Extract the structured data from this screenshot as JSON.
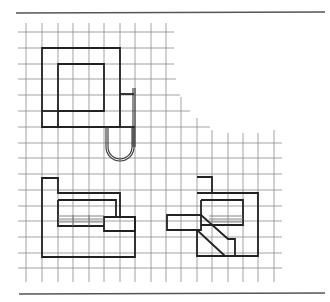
{
  "figure": {
    "type": "architectural plan diagrams on square grid",
    "colors": {
      "background": "#ffffff",
      "rule": "#555555",
      "grid": "#8a8a8a",
      "outline": "#222222"
    }
  },
  "rules": [
    {
      "name": "top-rule",
      "x1": 16,
      "y1": 13,
      "x2": 325,
      "y2": 12
    },
    {
      "name": "bottom-rule",
      "x1": 19,
      "y1": 294,
      "x2": 325,
      "y2": 293
    }
  ],
  "grid": {
    "verticals": [
      {
        "x": 26,
        "y1": 23,
        "y2": 282
      },
      {
        "x": 42,
        "y1": 23,
        "y2": 282
      },
      {
        "x": 58,
        "y1": 23,
        "y2": 282
      },
      {
        "x": 73,
        "y1": 23,
        "y2": 282
      },
      {
        "x": 89,
        "y1": 23,
        "y2": 282
      },
      {
        "x": 104,
        "y1": 23,
        "y2": 282
      },
      {
        "x": 120,
        "y1": 23,
        "y2": 282
      },
      {
        "x": 135,
        "y1": 23,
        "y2": 282
      },
      {
        "x": 151,
        "y1": 23,
        "y2": 282
      },
      {
        "x": 166,
        "y1": 23,
        "y2": 282
      },
      {
        "x": 181,
        "y1": 97,
        "y2": 282
      },
      {
        "x": 197,
        "y1": 118,
        "y2": 282
      },
      {
        "x": 212,
        "y1": 130,
        "y2": 282
      },
      {
        "x": 228,
        "y1": 133,
        "y2": 282
      },
      {
        "x": 243,
        "y1": 133,
        "y2": 282
      },
      {
        "x": 258,
        "y1": 133,
        "y2": 282
      },
      {
        "x": 274,
        "y1": 130,
        "y2": 282
      }
    ],
    "horizontals": [
      {
        "y": 32,
        "x1": 18,
        "x2": 174
      },
      {
        "y": 48,
        "x1": 18,
        "x2": 174
      },
      {
        "y": 64,
        "x1": 18,
        "x2": 174
      },
      {
        "y": 79,
        "x1": 18,
        "x2": 176
      },
      {
        "y": 95,
        "x1": 18,
        "x2": 180
      },
      {
        "y": 111,
        "x1": 18,
        "x2": 190
      },
      {
        "y": 127,
        "x1": 18,
        "x2": 210
      },
      {
        "y": 143,
        "x1": 18,
        "x2": 282
      },
      {
        "y": 158,
        "x1": 18,
        "x2": 282
      },
      {
        "y": 174,
        "x1": 18,
        "x2": 282
      },
      {
        "y": 190,
        "x1": 18,
        "x2": 282
      },
      {
        "y": 206,
        "x1": 18,
        "x2": 282
      },
      {
        "y": 221,
        "x1": 18,
        "x2": 282
      },
      {
        "y": 237,
        "x1": 18,
        "x2": 282
      },
      {
        "y": 253,
        "x1": 18,
        "x2": 282
      },
      {
        "y": 268,
        "x1": 18,
        "x2": 282
      }
    ]
  },
  "plans": {
    "upper_plan": {
      "outer_path": "M42,48 L120,48 L120,127 L42,127 Z",
      "inner_square": "M58,64 L104,64 L104,111 L58,111 Z",
      "inner_left_wall": "M58,111 L58,127",
      "corner_divider": "M42,111 L58,111",
      "annex_path": "M120,94 L134,94",
      "annex_post_outer": "M133,88 L133,147",
      "annex_post_inner": "M135,88 L135,147",
      "annex_bottom": "M120,127 L135,127",
      "loop_outer": "M106,127 L106,147 A14,14 0 0 0 134,147 L134,127",
      "loop_inner": "M108,127 L108,147 A12,12 0 0 0 132,147 L132,127"
    },
    "lower_left_plan": {
      "outer_path": "M42,178 L58,178 L58,193 L120,193 L120,217 L135,217 L135,257 L42,257 Z",
      "inner_path": "M58,200 L116,200 L116,217",
      "inner_box": "M58,200 L58,226 L104,226",
      "projecting_box": "M104,217 L135,217 L135,231 L104,231 Z",
      "treads_y": [
        216,
        219,
        222
      ],
      "treads_x1": 58,
      "treads_x2": 104,
      "tread_dividers_x": [
        73,
        89
      ]
    },
    "lower_right_plan": {
      "tower_box": "M197,177 L212,177 L212,193 L197,193",
      "outer_path": "M197,193 L258,193 L258,256 L197,256 L197,230",
      "inner_box": "M201,200 L243,200 L243,225 L201,225",
      "inner_left": "M201,200 L201,215",
      "side_bar": "M167,215 L201,215 L201,230 L167,230 Z",
      "stair_diag_top": "M201,215 L228,239 L235,239 L235,256",
      "stair_diag_bottom": "M197,230 L225,256",
      "treads_y": [
        216,
        219,
        222
      ],
      "treads_x1": 209,
      "treads_x2": 243
    }
  }
}
